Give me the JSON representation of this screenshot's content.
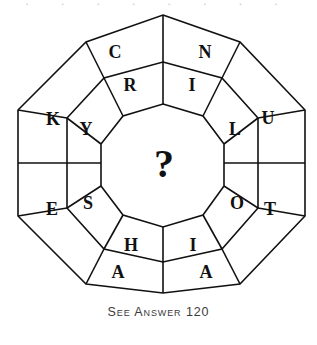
{
  "figure": {
    "type": "octagonal-ring-word-puzzle",
    "center_symbol": "?",
    "outer_ring": {
      "label": "outer-ring",
      "cells": [
        {
          "letter": "C",
          "position": "top-left",
          "cx": 115,
          "cy": 52
        },
        {
          "letter": "N",
          "position": "top-right",
          "cx": 205,
          "cy": 52
        },
        {
          "letter": "U",
          "position": "right-upper",
          "cx": 268,
          "cy": 118
        },
        {
          "letter": "T",
          "position": "right-lower",
          "cx": 270,
          "cy": 209
        },
        {
          "letter": "A",
          "position": "bottom-right",
          "cx": 206,
          "cy": 272
        },
        {
          "letter": "A",
          "position": "bottom-left",
          "cx": 118,
          "cy": 272
        },
        {
          "letter": "E",
          "position": "left-lower",
          "cx": 52,
          "cy": 209
        },
        {
          "letter": "K",
          "position": "left-upper",
          "cx": 53,
          "cy": 119
        }
      ]
    },
    "inner_ring": {
      "label": "inner-ring",
      "cells": [
        {
          "letter": "R",
          "position": "top-left",
          "cx": 130,
          "cy": 85
        },
        {
          "letter": "I",
          "position": "top-right",
          "cx": 192,
          "cy": 85
        },
        {
          "letter": "L",
          "position": "right-upper",
          "cx": 235,
          "cy": 129
        },
        {
          "letter": "O",
          "position": "right-lower",
          "cx": 237,
          "cy": 203
        },
        {
          "letter": "I",
          "position": "bottom-right",
          "cx": 193,
          "cy": 245
        },
        {
          "letter": "H",
          "position": "bottom-left",
          "cx": 131,
          "cy": 245
        },
        {
          "letter": "S",
          "position": "left-lower",
          "cx": 88,
          "cy": 203
        },
        {
          "letter": "Y",
          "position": "left-upper",
          "cx": 86,
          "cy": 129
        }
      ]
    }
  },
  "caption": {
    "text": "See Answer 120"
  },
  "page_bleed": {
    "top_text": "· · · · · · · ·"
  },
  "colors": {
    "ink": "#111111",
    "paper": "#ffffff",
    "caption_ink": "#3b3b3b"
  }
}
